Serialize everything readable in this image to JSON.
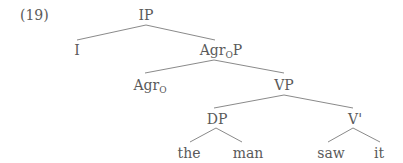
{
  "example_number": "(19)",
  "tree": {
    "nodes": {
      "ip": {
        "label": "IP"
      },
      "i": {
        "label": "I"
      },
      "agrop": {
        "label": "Agr",
        "subscript": "O",
        "suffix": "P"
      },
      "agro": {
        "label": "Agr",
        "subscript": "O"
      },
      "vp": {
        "label": "VP"
      },
      "dp": {
        "label": "DP"
      },
      "vbar": {
        "label": "V'"
      },
      "the": {
        "label": "the"
      },
      "man": {
        "label": "man"
      },
      "saw": {
        "label": "saw"
      },
      "it": {
        "label": "it"
      }
    },
    "edges": [
      [
        "IP",
        "I"
      ],
      [
        "IP",
        "AgrOP"
      ],
      [
        "AgrOP",
        "AgrO"
      ],
      [
        "AgrOP",
        "VP"
      ],
      [
        "VP",
        "DP"
      ],
      [
        "VP",
        "V'"
      ],
      [
        "DP",
        "the"
      ],
      [
        "DP",
        "man"
      ],
      [
        "V'",
        "saw"
      ],
      [
        "V'",
        "it"
      ]
    ]
  }
}
